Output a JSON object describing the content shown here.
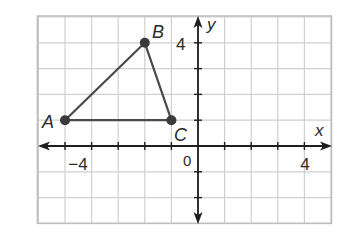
{
  "figure": {
    "type": "coordinate-plane",
    "grid": {
      "x_min": -6,
      "x_max": 5,
      "y_min": -3,
      "y_max": 5,
      "visible": true
    },
    "axes": {
      "x_label": "x",
      "y_label": "y",
      "origin_label": "0",
      "x_tick_labels": [
        {
          "value": -4,
          "text": "−4"
        },
        {
          "value": 4,
          "text": "4"
        }
      ],
      "y_tick_labels": [
        {
          "value": 4,
          "text": "4"
        }
      ]
    },
    "triangle": {
      "vertices": [
        {
          "label": "A",
          "x": -5,
          "y": 1
        },
        {
          "label": "B",
          "x": -2,
          "y": 4
        },
        {
          "label": "C",
          "x": -1,
          "y": 1
        }
      ]
    },
    "colors": {
      "grid": "#cfcfcf",
      "border": "#bdbdbd",
      "axis": "#1e1e1e",
      "triangle": "#4a4a4a",
      "point": "#3a3a3a"
    }
  }
}
